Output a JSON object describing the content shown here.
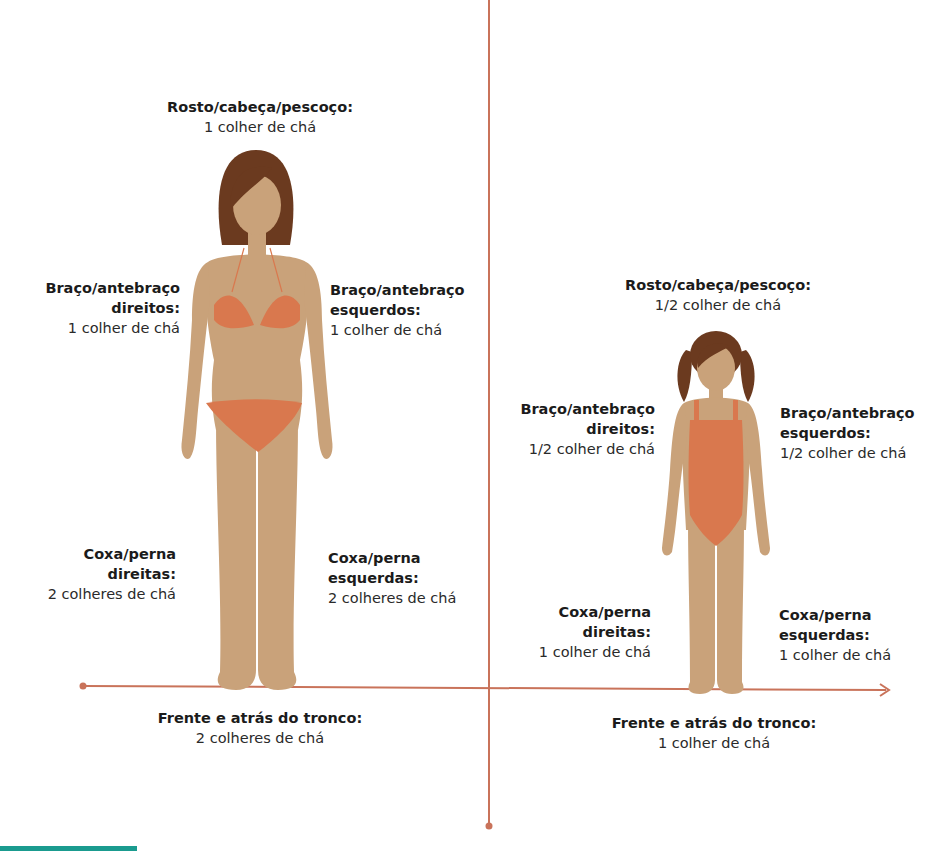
{
  "colors": {
    "skin": "#c9a27a",
    "hair": "#6b3a1f",
    "swimsuit": "#d9784e",
    "axis": "#c9735a",
    "teal_bar": "#1a9b8f",
    "text": "#1b1b1b"
  },
  "adult": {
    "head": {
      "title": "Rosto/cabeça/pescoço:",
      "value": "1 colher de chá"
    },
    "right_arm": {
      "title_line1": "Braço/antebraço",
      "title_line2": "direitos:",
      "value": "1 colher de chá"
    },
    "left_arm": {
      "title_line1": "Braço/antebraço",
      "title_line2": "esquerdos:",
      "value": "1 colher de chá"
    },
    "right_leg": {
      "title_line1": "Coxa/perna",
      "title_line2": "direitas:",
      "value": "2 colheres de chá"
    },
    "left_leg": {
      "title_line1": "Coxa/perna",
      "title_line2": "esquerdas:",
      "value": "2 colheres de chá"
    },
    "trunk": {
      "title": "Frente e atrás do tronco:",
      "value": "2 colheres de chá"
    }
  },
  "child": {
    "head": {
      "title": "Rosto/cabeça/pescoço:",
      "value": "1/2 colher de chá"
    },
    "right_arm": {
      "title_line1": "Braço/antebraço",
      "title_line2": "direitos:",
      "value": "1/2 colher de chá"
    },
    "left_arm": {
      "title_line1": "Braço/antebraço",
      "title_line2": "esquerdos:",
      "value": "1/2 colher de chá"
    },
    "right_leg": {
      "title_line1": "Coxa/perna",
      "title_line2": "direitas:",
      "value": "1 colher de chá"
    },
    "left_leg": {
      "title_line1": "Coxa/perna",
      "title_line2": "esquerdas:",
      "value": "1 colher de chá"
    },
    "trunk": {
      "title": "Frente e atrás do tronco:",
      "value": "1 colher de chá"
    }
  }
}
